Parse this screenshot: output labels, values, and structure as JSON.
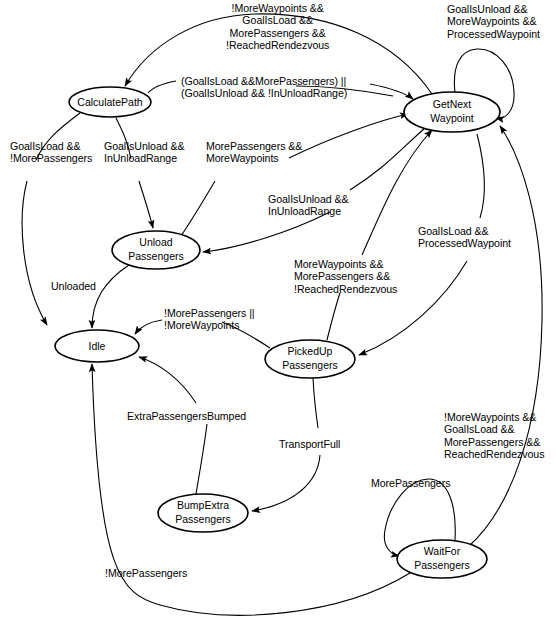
{
  "diagram": {
    "type": "state-machine",
    "width": 557,
    "height": 629,
    "background_color": "#ffffff",
    "stroke_color": "#000000",
    "nodes": [
      {
        "id": "calculatepath",
        "label": "CalculatePath",
        "lines": [
          "CalculatePath"
        ],
        "cx": 110,
        "cy": 102,
        "rx": 41,
        "ry": 15
      },
      {
        "id": "getnextwaypoint",
        "label": "GetNext Waypoint",
        "lines": [
          "GetNext",
          "Waypoint"
        ],
        "cx": 452,
        "cy": 112,
        "rx": 48,
        "ry": 20
      },
      {
        "id": "unloadpassengers",
        "label": "Unload Passengers",
        "lines": [
          "Unload",
          "Passengers"
        ],
        "cx": 156,
        "cy": 250,
        "rx": 44,
        "ry": 19
      },
      {
        "id": "idle",
        "label": "Idle",
        "lines": [
          "Idle"
        ],
        "cx": 97,
        "cy": 346,
        "rx": 42,
        "ry": 16
      },
      {
        "id": "pickeduppassengers",
        "label": "PickedUp Passengers",
        "lines": [
          "PickedUp",
          "Passengers"
        ],
        "cx": 310,
        "cy": 359,
        "rx": 45,
        "ry": 19
      },
      {
        "id": "bumpextrapassengers",
        "label": "BumpExtra Passengers",
        "lines": [
          "BumpExtra",
          "Passengers"
        ],
        "cx": 203,
        "cy": 513,
        "rx": 45,
        "ry": 19
      },
      {
        "id": "waitforpassengers",
        "label": "WaitFor Passengers",
        "lines": [
          "WaitFor",
          "Passengers"
        ],
        "cx": 442,
        "cy": 559,
        "rx": 45,
        "ry": 19
      }
    ],
    "edges": [
      {
        "id": "e1",
        "from": "getnextwaypoint",
        "to": "calculatepath",
        "label": "!MoreWaypoints &&\nGoalIsLoad &&\nMorePassengers &&\n!ReachedRendezvous",
        "label_x": 226,
        "label_y": 2,
        "align": "center"
      },
      {
        "id": "e2",
        "from": "getnextwaypoint",
        "to": "getnextwaypoint",
        "label": "GoalIsUnload &&\nMoreWaypoints &&\nProcessedWaypoint",
        "label_x": 447,
        "label_y": 3,
        "align": "left"
      },
      {
        "id": "e3",
        "from": "calculatepath",
        "to": "getnextwaypoint",
        "label": "(GoalIsLoad &&MorePassengers) ||\n(GoalIsUnload && !InUnloadRange)",
        "label_x": 181,
        "label_y": 75,
        "align": "left"
      },
      {
        "id": "e4",
        "from": "calculatepath",
        "to": "idle",
        "label": "GoalIsLoad &&\n!MorePassengers",
        "label_x": 10,
        "label_y": 140,
        "align": "left"
      },
      {
        "id": "e5",
        "from": "calculatepath",
        "to": "unloadpassengers",
        "label": "GoalIsUnload &&\nInUnloadRange",
        "label_x": 104,
        "label_y": 140,
        "align": "left"
      },
      {
        "id": "e6",
        "from": "unloadpassengers",
        "to": "getnextwaypoint",
        "label": "MorePassengers &&\nMoreWaypoints",
        "label_x": 206,
        "label_y": 140,
        "align": "left"
      },
      {
        "id": "e7",
        "from": "getnextwaypoint",
        "to": "unloadpassengers",
        "label": "GoalIsUnload &&\nInUnloadRange",
        "label_x": 268,
        "label_y": 193,
        "align": "left"
      },
      {
        "id": "e8",
        "from": "getnextwaypoint",
        "to": "pickeduppassengers",
        "label": "GoalIsLoad &&\nProcessedWaypoint",
        "label_x": 418,
        "label_y": 225,
        "align": "left"
      },
      {
        "id": "e9",
        "from": "pickeduppassengers",
        "to": "getnextwaypoint",
        "label": "MoreWaypoints &&\nMorePassengers &&\n!ReachedRendezvous",
        "label_x": 294,
        "label_y": 258,
        "align": "left"
      },
      {
        "id": "e10",
        "from": "unloadpassengers",
        "to": "idle",
        "label": "Unloaded",
        "label_x": 51,
        "label_y": 280,
        "align": "left"
      },
      {
        "id": "e11",
        "from": "pickeduppassengers",
        "to": "idle",
        "label": "!MorePassengers ||\n!MoreWaypoints",
        "label_x": 164,
        "label_y": 307,
        "align": "left"
      },
      {
        "id": "e12",
        "from": "waitforpassengers",
        "to": "getnextwaypoint",
        "label": "!MoreWaypoints &&\nGoalIsLoad &&\nMorePassengers &&\nReachedRendezvous",
        "label_x": 444,
        "label_y": 411,
        "align": "left"
      },
      {
        "id": "e13",
        "from": "bumpextrapassengers",
        "to": "idle",
        "label": "ExtraPassengersBumped",
        "label_x": 127,
        "label_y": 410,
        "align": "left"
      },
      {
        "id": "e14",
        "from": "pickeduppassengers",
        "to": "bumpextrapassengers",
        "label": "TransportFull",
        "label_x": 279,
        "label_y": 438,
        "align": "left"
      },
      {
        "id": "e15",
        "from": "waitforpassengers",
        "to": "waitforpassengers",
        "label": "MorePassengers",
        "label_x": 371,
        "label_y": 477,
        "align": "left"
      },
      {
        "id": "e16",
        "from": "waitforpassengers",
        "to": "idle",
        "label": "!MorePassengers",
        "label_x": 105,
        "label_y": 567,
        "align": "left"
      }
    ]
  }
}
